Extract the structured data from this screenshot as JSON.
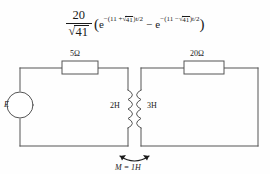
{
  "equation": {
    "fraction_numerator": "20",
    "fraction_denominator_radicand": "41",
    "radical_sign": "√",
    "open_paren": "(",
    "close_paren": ")",
    "term1_base": "e",
    "term1_exponent_prefix": "−(11 +",
    "term1_exponent_radicand": "41",
    "term1_exponent_suffix": ")t/2",
    "operator": "−",
    "term2_base": "e",
    "term2_exponent_prefix": "−(11 −",
    "term2_exponent_radicand": "41",
    "term2_exponent_suffix": ")t/2",
    "plain_text": "20/√41 (e^{-(11+√41)t/2} − e^{-(11−√41)t/2})"
  },
  "circuit": {
    "source_label": "E",
    "resistor_left_label": "5Ω",
    "resistor_right_label": "20Ω",
    "inductor_left_label": "2H",
    "inductor_right_label": "3H",
    "mutual_label": "M = 1H",
    "line_color": "#555555",
    "text_color": "#1a1a1a",
    "fill_color": "#ffffff"
  }
}
